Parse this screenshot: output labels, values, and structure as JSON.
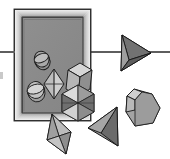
{
  "scene": {
    "title": "Geometric solids beside a framed mirror",
    "width": 170,
    "height": 159,
    "background_color": "#ffffff",
    "description": "Grayscale line-art rendering of polyhedra scattered in front of and inside a rectangular picture frame, with a horizontal horizon line crossing the image."
  },
  "palette": {
    "background": "#ffffff",
    "frame_outer": "#f2f2f2",
    "frame_bevel_light": "#d9d9d9",
    "frame_bevel_mid": "#b3b3b3",
    "frame_bevel_dark": "#6e6e6e",
    "frame_interior": "#8c8c8c",
    "outline": "#1a1a1a",
    "solid_light": "#d2d2d2",
    "solid_mid": "#a8a8a8",
    "solid_dark": "#7a7a7a",
    "solid_darkest": "#5a5a5a",
    "horizon_line": "#5e5e5e"
  },
  "frame": {
    "label": "picture-frame",
    "x": 14,
    "y": 9,
    "width": 77,
    "height": 112,
    "border_thickness": 7,
    "interior_fill": "#8c8c8c"
  },
  "horizon": {
    "label": "horizon-line",
    "y": 52,
    "x_start": 0,
    "x_end": 170,
    "thickness": 2,
    "color": "#5e5e5e"
  },
  "left_tick": {
    "label": "left-edge-tick",
    "x": 0,
    "y": 72,
    "width": 3,
    "height": 7
  },
  "solids": [
    {
      "id": "disk-upper-inside",
      "name": "tilted-cylinder-disk",
      "location": "inside-frame-upper-left",
      "cx": 42,
      "cy": 60,
      "rx": 8,
      "ry": 9,
      "fill": "#a8a8a8",
      "shading": "split"
    },
    {
      "id": "disk-lower-inside",
      "name": "tilted-cylinder-disk",
      "location": "inside-frame-lower-left",
      "cx": 36,
      "cy": 91,
      "rx": 9,
      "ry": 9,
      "fill": "#b5b5b5",
      "shading": "split"
    },
    {
      "id": "bipyramid-inside",
      "name": "small-bipyramid",
      "location": "inside-frame-center",
      "cx": 54,
      "cy": 84,
      "half_width": 10,
      "half_height": 15,
      "fill": "#cfcfcf"
    },
    {
      "id": "box-center",
      "name": "parallelepiped-box",
      "location": "frame-right-edge-overlap",
      "cx": 80,
      "cy": 78,
      "fill_top": "#d2d2d2",
      "fill_front": "#b0b0b0",
      "fill_side": "#8f8f8f"
    },
    {
      "id": "octahedron-center",
      "name": "faceted-octahedron",
      "location": "frame-bottom-edge-overlap",
      "cx": 78,
      "cy": 103,
      "half_width": 16,
      "half_height": 18,
      "facets": 6,
      "fill_light": "#d8d8d8",
      "fill_dark": "#6f6f6f"
    },
    {
      "id": "pyramid-right",
      "name": "right-pointing-tetrahedron",
      "location": "upper-right-on-horizon",
      "cx": 136,
      "cy": 52,
      "fill_top": "#8a8a8a",
      "fill_bottom": "#5a5a5a",
      "fill_right": "#777777"
    },
    {
      "id": "hexprism-right",
      "name": "hexagonal-prism",
      "location": "lower-right",
      "cx": 141,
      "cy": 107,
      "radius": 17,
      "fill_face": "#a0a0a0",
      "fill_bevel": "#c6c6c6"
    },
    {
      "id": "cone-bottom",
      "name": "left-leaning-cone",
      "location": "bottom-center",
      "cx": 103,
      "cy": 130,
      "fill_left": "#9b9b9b",
      "fill_right": "#6b6b6b"
    },
    {
      "id": "bipyramid-bottom-left",
      "name": "diamond-bipyramid",
      "location": "bottom-left",
      "cx": 59,
      "cy": 134,
      "half_width": 12,
      "half_height": 20,
      "fill_light": "#d6d6d6",
      "fill_dark": "#8e8e8e"
    }
  ]
}
